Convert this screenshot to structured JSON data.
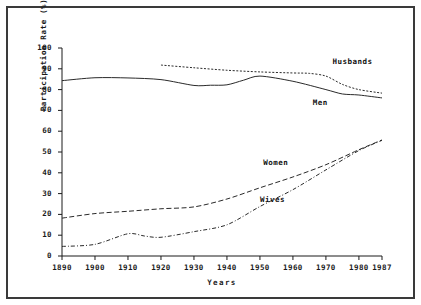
{
  "chart_data": {
    "type": "line",
    "title": "",
    "xlabel": "Years",
    "ylabel": "Participation Rate (%)",
    "xlim": [
      1890,
      1987
    ],
    "ylim": [
      0,
      100
    ],
    "grid": false,
    "legend_position": "inline-annotations",
    "xticks": [
      "1890",
      "1900",
      "1910",
      "1920",
      "1930",
      "1940",
      "1950",
      "1960",
      "1970",
      "1980",
      "1987"
    ],
    "xtick_values": [
      1890,
      1900,
      1910,
      1920,
      1930,
      1940,
      1950,
      1960,
      1970,
      1980,
      1987
    ],
    "yticks": [
      "0",
      "10",
      "20",
      "30",
      "40",
      "50",
      "60",
      "70",
      "80",
      "90",
      "100"
    ],
    "ytick_values": [
      0,
      10,
      20,
      30,
      40,
      50,
      60,
      70,
      80,
      90,
      100
    ],
    "series": [
      {
        "name": "Husbands",
        "style": "dotted",
        "x": [
          1920,
          1930,
          1940,
          1950,
          1960,
          1965,
          1970,
          1975,
          1980,
          1987
        ],
        "values": [
          91.8,
          90.5,
          89.3,
          88.5,
          88.0,
          87.8,
          86.5,
          82.5,
          80.0,
          78.3
        ]
      },
      {
        "name": "Men",
        "style": "solid",
        "x": [
          1890,
          1900,
          1910,
          1920,
          1930,
          1935,
          1940,
          1945,
          1950,
          1960,
          1970,
          1975,
          1980,
          1987
        ],
        "values": [
          84.3,
          85.7,
          85.6,
          84.8,
          82.0,
          82.1,
          82.3,
          84.5,
          86.5,
          84.0,
          80.0,
          77.9,
          77.4,
          76.0
        ]
      },
      {
        "name": "Women",
        "style": "dashed",
        "x": [
          1890,
          1900,
          1910,
          1920,
          1930,
          1940,
          1950,
          1960,
          1970,
          1980,
          1987
        ],
        "values": [
          18.2,
          20.4,
          21.5,
          22.7,
          23.6,
          27.4,
          32.8,
          38.0,
          43.9,
          51.1,
          55.8
        ]
      },
      {
        "name": "Wives",
        "style": "dash-dot",
        "x": [
          1890,
          1900,
          1910,
          1915,
          1920,
          1930,
          1940,
          1950,
          1960,
          1970,
          1980,
          1987
        ],
        "values": [
          4.6,
          5.6,
          10.7,
          9.6,
          9.0,
          11.7,
          15.0,
          23.8,
          31.9,
          41.4,
          50.7,
          55.6
        ]
      }
    ],
    "annotations": [
      {
        "text": "Husbands",
        "x": 1972,
        "y": 93.5
      },
      {
        "text": "Men",
        "x": 1966,
        "y": 73.5
      },
      {
        "text": "Women",
        "x": 1951,
        "y": 44.5
      },
      {
        "text": "Wives",
        "x": 1950,
        "y": 27.0
      }
    ]
  },
  "colors": {
    "frame": "#3a3a3a",
    "axis": "#1a1a1a",
    "line": "#2a2a2a",
    "background": "#ffffff",
    "text": "#111111"
  }
}
